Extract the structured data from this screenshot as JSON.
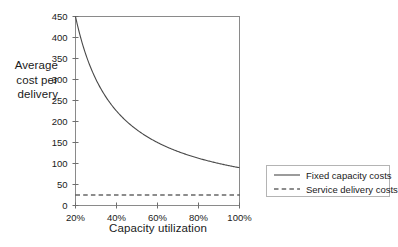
{
  "chart_data": {
    "type": "line",
    "title": "",
    "xlabel": "Capacity utilization",
    "ylabel": "Average cost per delivery",
    "ylabel_lines": [
      "Average",
      "cost per",
      "delivery"
    ],
    "xlim": [
      20,
      100
    ],
    "ylim": [
      0,
      450
    ],
    "grid": false,
    "legend_position": "right",
    "x_tick_labels": [
      "20%",
      "40%",
      "60%",
      "80%",
      "100%"
    ],
    "x_tick_values": [
      20,
      40,
      60,
      80,
      100
    ],
    "y_tick_labels": [
      "0",
      "50",
      "100",
      "150",
      "200",
      "250",
      "300",
      "350",
      "400",
      "450"
    ],
    "y_tick_values": [
      0,
      50,
      100,
      150,
      200,
      250,
      300,
      350,
      400,
      450
    ],
    "x": [
      20,
      25,
      30,
      35,
      40,
      45,
      50,
      55,
      60,
      65,
      70,
      75,
      80,
      85,
      90,
      95,
      100
    ],
    "series": [
      {
        "name": "Fixed capacity costs",
        "style": "solid",
        "color": "#4a4a4a",
        "values": [
          450,
          360,
          300,
          257,
          225,
          200,
          180,
          164,
          150,
          138,
          129,
          120,
          113,
          106,
          100,
          95,
          90
        ]
      },
      {
        "name": "Service delivery costs",
        "style": "dashed",
        "color": "#1a1a1a",
        "values": [
          25,
          25,
          25,
          25,
          25,
          25,
          25,
          25,
          25,
          25,
          25,
          25,
          25,
          25,
          25,
          25,
          25
        ]
      }
    ],
    "annotations": []
  },
  "legend": {
    "entries": [
      {
        "label": "Fixed capacity costs",
        "style": "solid"
      },
      {
        "label": "Service delivery costs",
        "style": "dashed"
      }
    ]
  },
  "colors": {
    "axis": "#6e6e6e",
    "curve": "#4a4a4a",
    "dashed": "#1a1a1a",
    "legend_border": "#b4b4b4",
    "background": "#ffffff",
    "text": "#1a1a1a"
  }
}
